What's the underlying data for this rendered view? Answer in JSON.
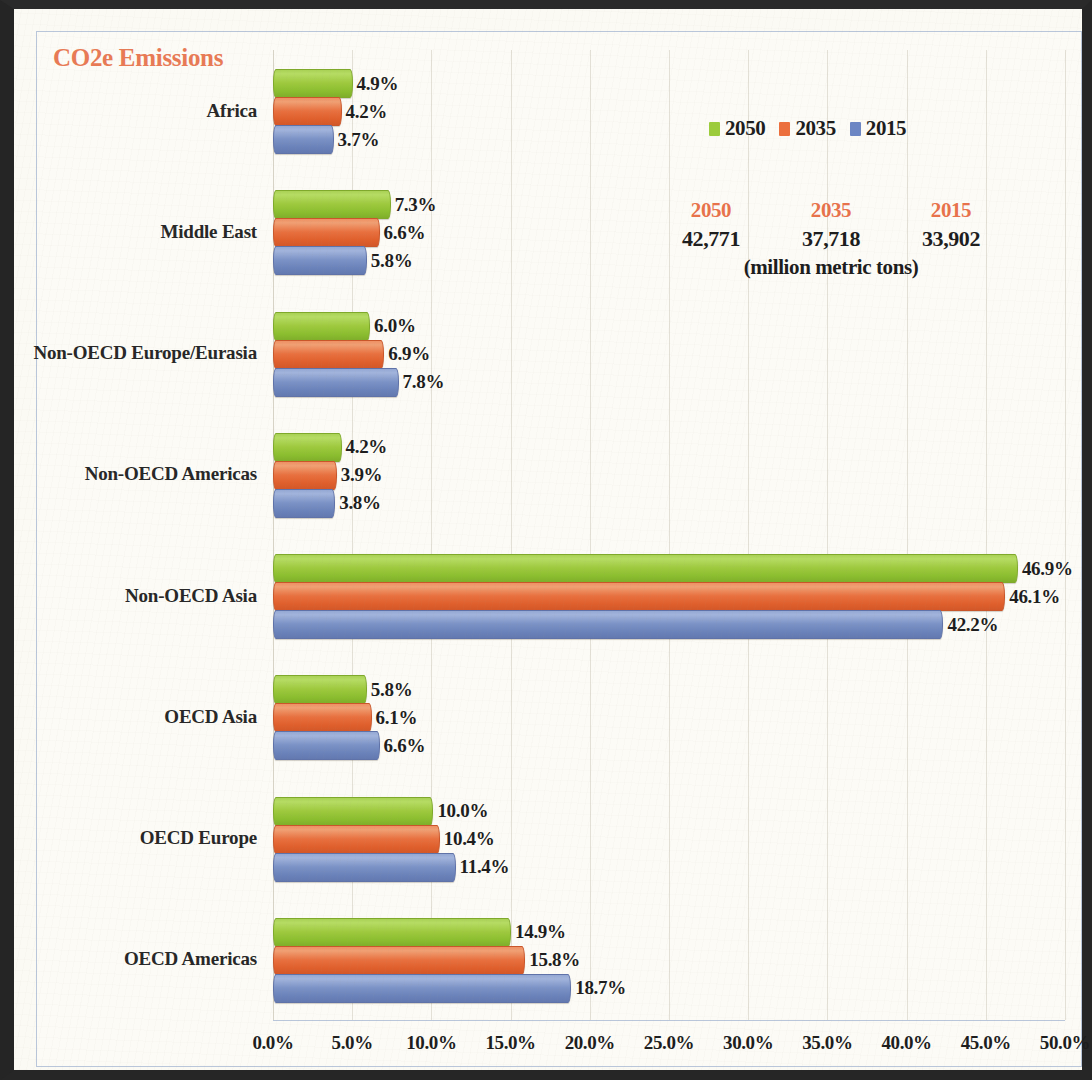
{
  "chart_data": {
    "type": "bar",
    "orientation": "horizontal",
    "title": "CO2e Emissions",
    "xlabel": "",
    "ylabel": "",
    "xlim": [
      0,
      50
    ],
    "x_ticks": [
      "0.0%",
      "5.0%",
      "10.0%",
      "15.0%",
      "20.0%",
      "25.0%",
      "30.0%",
      "35.0%",
      "40.0%",
      "45.0%",
      "50.0%"
    ],
    "x_tick_values": [
      0,
      5,
      10,
      15,
      20,
      25,
      30,
      35,
      40,
      45,
      50
    ],
    "grid": true,
    "legend_position": "top-right",
    "categories": [
      "Africa",
      "Middle East",
      "Non-OECD Europe/Eurasia",
      "Non-OECD Americas",
      "Non-OECD Asia",
      "OECD Asia",
      "OECD Europe",
      "OECD Americas"
    ],
    "series": [
      {
        "name": "2050",
        "color": "#9ccc3c",
        "values": [
          4.9,
          7.3,
          6.0,
          4.2,
          46.9,
          5.8,
          10.0,
          14.9
        ],
        "labels": [
          "4.9%",
          "7.3%",
          "6.0%",
          "4.2%",
          "46.9%",
          "5.8%",
          "10.0%",
          "14.9%"
        ]
      },
      {
        "name": "2035",
        "color": "#ec6f3d",
        "values": [
          4.2,
          6.6,
          6.9,
          3.9,
          46.1,
          6.1,
          10.4,
          15.8
        ],
        "labels": [
          "4.2%",
          "6.6%",
          "6.9%",
          "3.9%",
          "46.1%",
          "6.1%",
          "10.4%",
          "15.8%"
        ]
      },
      {
        "name": "2015",
        "color": "#6c86c4",
        "values": [
          3.7,
          5.8,
          7.8,
          3.8,
          42.2,
          6.6,
          11.4,
          18.7
        ],
        "labels": [
          "3.7%",
          "5.8%",
          "7.8%",
          "3.8%",
          "42.2%",
          "6.6%",
          "11.4%",
          "18.7%"
        ]
      }
    ],
    "annotations": {
      "totals_years": [
        "2050",
        "2035",
        "2015"
      ],
      "totals_values": [
        "42,771",
        "37,718",
        "33,902"
      ],
      "totals_units": "(million metric tons)"
    }
  },
  "legend": {
    "items": [
      {
        "label": "2050",
        "swatch": "green"
      },
      {
        "label": "2035",
        "swatch": "orange"
      },
      {
        "label": "2015",
        "swatch": "blue"
      }
    ]
  },
  "colors": {
    "green": "#9ccc3c",
    "orange": "#ec6f3d",
    "blue": "#6c86c4",
    "title": "#e87a55",
    "frame": "#b9c6da",
    "paper": "#fbfaf4"
  }
}
